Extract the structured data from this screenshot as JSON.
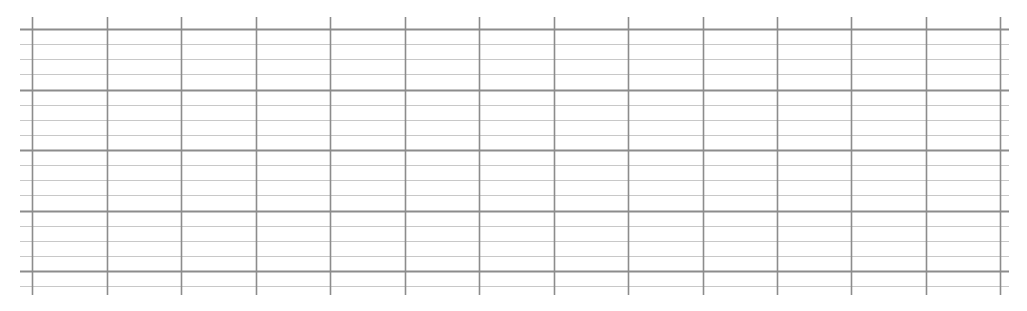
{
  "grid": {
    "x_start": 20,
    "x_end": 1009,
    "y_start": 17,
    "y_end": 295,
    "vertical_lines_x": [
      32,
      107,
      181,
      256,
      330,
      405,
      479,
      554,
      628,
      703,
      777,
      851,
      926,
      1000
    ],
    "horizontal_first_y": 29,
    "horizontal_spacing": 15.125,
    "horizontal_count": 18,
    "major_every": 4,
    "colors": {
      "vertical": "#8c8c8c",
      "major": "#8c8c8c",
      "minor": "#c8c8c8",
      "background": "#ffffff"
    }
  }
}
